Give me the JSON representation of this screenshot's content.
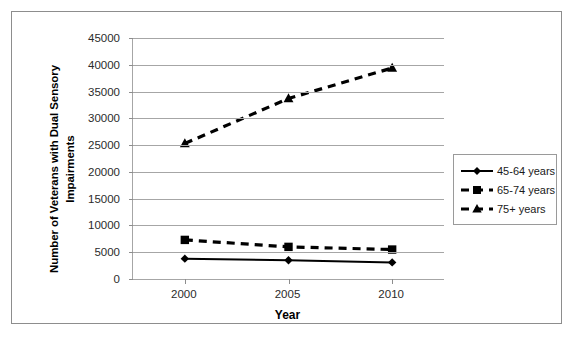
{
  "chart_data": {
    "type": "line",
    "title": "",
    "xlabel": "Year",
    "ylabel": "Number of Veterans with Dual Sensory Impairments",
    "ylabel_line1": "Number of Veterans with Dual Sensory",
    "ylabel_line2": "Impairments",
    "categories": [
      "2000",
      "2005",
      "2010"
    ],
    "x": [
      2000,
      2005,
      2010
    ],
    "xlim": [
      1997.5,
      2012.5
    ],
    "ylim": [
      0,
      45000
    ],
    "ytick_labels": [
      "45000",
      "40000",
      "35000",
      "30000",
      "25000",
      "20000",
      "15000",
      "10000",
      "5000",
      "0"
    ],
    "yticks": [
      45000,
      40000,
      35000,
      30000,
      25000,
      20000,
      15000,
      10000,
      5000,
      0
    ],
    "grid": true,
    "legend_position": "right",
    "series": [
      {
        "name": "45-64 years",
        "values": [
          3800,
          3500,
          3100
        ],
        "marker": "diamond",
        "line_style": "solid",
        "color": "#000000"
      },
      {
        "name": "65-74 years",
        "values": [
          7300,
          6000,
          5500
        ],
        "marker": "square",
        "line_style": "dashed",
        "color": "#000000"
      },
      {
        "name": "75+ years",
        "values": [
          25300,
          33700,
          39400
        ],
        "marker": "triangle",
        "line_style": "dashed",
        "color": "#000000"
      }
    ]
  },
  "legend": {
    "items": [
      {
        "label": "45-64 years"
      },
      {
        "label": "65-74 years"
      },
      {
        "label": "75+ years"
      }
    ]
  },
  "colors": {
    "series": "#000000",
    "gridline": "#a6a6a6",
    "frame": "#8d8d8d",
    "text": "#000000"
  }
}
